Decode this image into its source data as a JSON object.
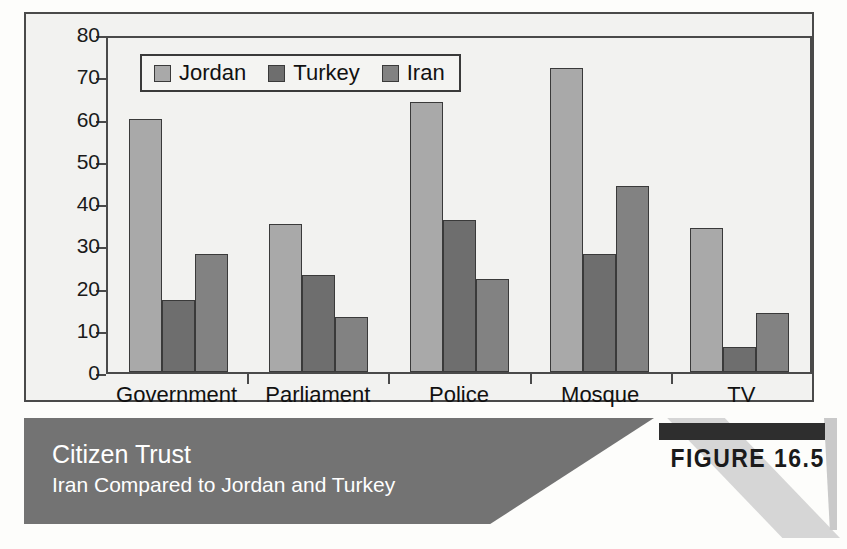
{
  "figure": {
    "badge_label": "FIGURE 16.5",
    "banner_title": "Citizen Trust",
    "banner_subtitle": "Iran Compared to Jordan and Turkey"
  },
  "colors": {
    "jordan": "#a9a9a9",
    "turkey": "#6e6e6e",
    "iran": "#828282",
    "banner": "#737373",
    "axis": "#4a4a4a",
    "plot_background": "#f2f2f0"
  },
  "chart_data": {
    "type": "bar",
    "title": "Citizen Trust",
    "subtitle": "Iran Compared to Jordan and Turkey",
    "xlabel": "",
    "ylabel": "",
    "ylim": [
      0,
      80
    ],
    "yticks": [
      0,
      10,
      20,
      30,
      40,
      50,
      60,
      70,
      80
    ],
    "ytick_labels": [
      "0",
      "10",
      "20",
      "30",
      "40",
      "50",
      "60",
      "70",
      "80"
    ],
    "grid": false,
    "legend_position": "top-left",
    "categories": [
      "Government",
      "Parliament",
      "Police",
      "Mosque",
      "TV"
    ],
    "series": [
      {
        "name": "Jordan",
        "color": "#a9a9a9",
        "values": [
          60,
          35,
          64,
          72,
          34
        ]
      },
      {
        "name": "Turkey",
        "color": "#6e6e6e",
        "values": [
          17,
          23,
          36,
          28,
          6
        ]
      },
      {
        "name": "Iran",
        "color": "#828282",
        "values": [
          28,
          13,
          22,
          44,
          14
        ]
      }
    ]
  }
}
